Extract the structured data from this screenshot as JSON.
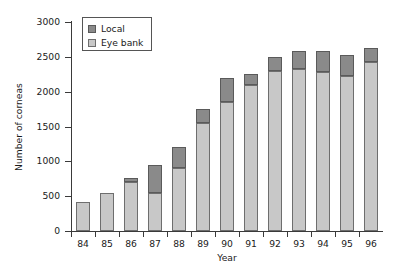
{
  "chart_data": {
    "type": "bar",
    "title": "",
    "xlabel": "Year",
    "ylabel": "Number of corneas",
    "categories": [
      "84",
      "85",
      "86",
      "87",
      "88",
      "89",
      "90",
      "91",
      "92",
      "93",
      "94",
      "95",
      "96"
    ],
    "series": [
      {
        "name": "Eye bank",
        "color": "#c8c8c8",
        "values": [
          420,
          540,
          700,
          550,
          910,
          1550,
          1850,
          2100,
          2300,
          2330,
          2280,
          2230,
          2420
        ]
      },
      {
        "name": "Local",
        "color": "#8a8a8a",
        "values": [
          0,
          0,
          60,
          400,
          290,
          200,
          340,
          160,
          200,
          260,
          310,
          300,
          200
        ]
      }
    ],
    "totals": [
      420,
      540,
      760,
      950,
      1200,
      1750,
      2190,
      2260,
      2500,
      2590,
      2590,
      2530,
      2620
    ],
    "stacked": true,
    "stack_order": [
      "Eye bank",
      "Local"
    ],
    "ylim": [
      0,
      3000
    ],
    "yticks": [
      0,
      500,
      1000,
      1500,
      2000,
      2500,
      3000
    ],
    "ytick_labels": [
      "0",
      "500",
      "1000",
      "1500",
      "2000",
      "2500",
      "3000"
    ],
    "grid": false,
    "legend": {
      "position": "top-left",
      "entries": [
        {
          "label": "Local",
          "color": "#8a8a8a"
        },
        {
          "label": "Eye bank",
          "color": "#c8c8c8"
        }
      ]
    }
  }
}
